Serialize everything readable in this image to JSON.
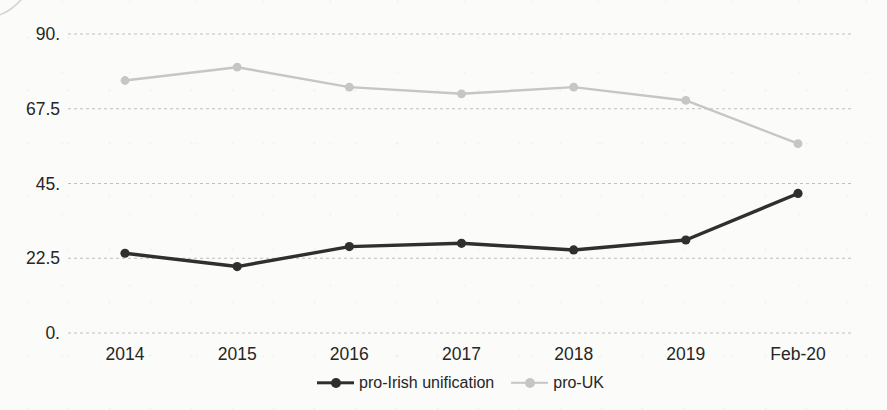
{
  "chart_data": {
    "type": "line",
    "categories": [
      "2014",
      "2015",
      "2016",
      "2017",
      "2018",
      "2019",
      "Feb-20"
    ],
    "series": [
      {
        "name": "pro-Irish unification",
        "values": [
          24,
          20,
          26,
          27,
          25,
          28,
          42
        ],
        "color": "#2f2f2f",
        "line_width": 3.4,
        "marker_radius": 4.6
      },
      {
        "name": "pro-UK",
        "values": [
          76,
          80,
          74,
          72,
          74,
          70,
          57
        ],
        "color": "#c6c6c6",
        "line_width": 2.4,
        "marker_radius": 4.4
      }
    ],
    "y_axis": {
      "range": [
        0,
        90
      ],
      "ticks": [
        {
          "value": 0,
          "label": "0."
        },
        {
          "value": 22.5,
          "label": "22.5"
        },
        {
          "value": 45,
          "label": "45."
        },
        {
          "value": 67.5,
          "label": "67.5"
        },
        {
          "value": 90,
          "label": "90."
        }
      ],
      "grid": "dashed-horizontal"
    },
    "legend": {
      "position": "bottom-center"
    }
  },
  "style": {
    "background": "#fbfbf9",
    "grid_color": "#bfbfbf",
    "text_color": "#262626"
  }
}
